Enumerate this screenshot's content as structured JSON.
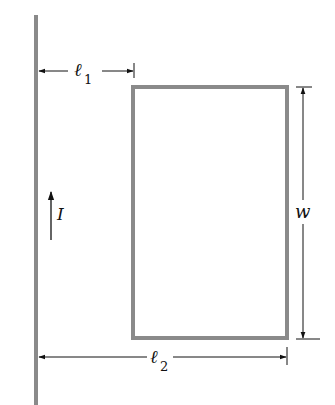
{
  "diagram": {
    "colors": {
      "wire": "#8a8a8a",
      "loop": "#8a8a8a",
      "dimension": "#111111",
      "background": "#ffffff"
    },
    "wire": {
      "label": "I",
      "direction": "up"
    },
    "loop": {
      "shape": "rectangle"
    },
    "dimensions": {
      "l1": {
        "symbol": "ℓ",
        "subscript": "1",
        "meaning": "distance from wire to near side of loop"
      },
      "l2": {
        "symbol": "ℓ",
        "subscript": "2",
        "meaning": "distance from wire to far side of loop"
      },
      "w": {
        "symbol": "w",
        "meaning": "height of loop"
      }
    }
  }
}
